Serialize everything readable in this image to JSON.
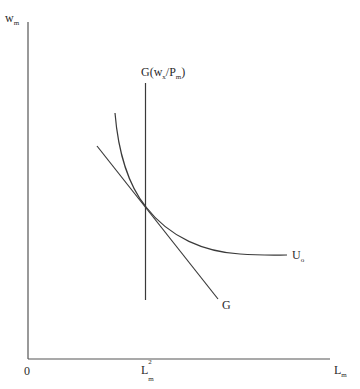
{
  "diagram": {
    "type": "economics-indifference-tangency",
    "y_axis": {
      "label_base": "w",
      "label_sub": "m"
    },
    "x_axis": {
      "label_base": "L",
      "label_sub": "m",
      "origin_label": "0"
    },
    "tick_label": {
      "base": "L",
      "sup": "2",
      "sub": "m"
    },
    "vertical_line_label": {
      "prefix": "G(w",
      "sub1": "x",
      "mid": "/P",
      "sub2": "m",
      "suffix": ")"
    },
    "curve_label": {
      "base": "U",
      "sub": "o"
    },
    "budget_line_label": "G",
    "colors": {
      "line": "#3a3a3a",
      "background": "#ffffff"
    }
  }
}
